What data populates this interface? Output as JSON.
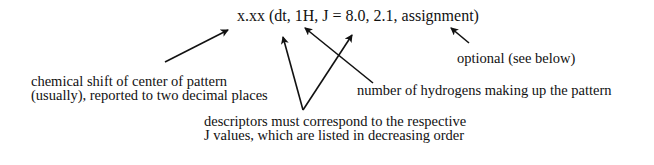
{
  "diagram": {
    "format_string": "x.xx (dt, 1H, J = 8.0, 2.1, assignment)",
    "annotations": {
      "chemical_shift": {
        "line1": "chemical shift of center of pattern",
        "line2": "(usually), reported to two decimal places"
      },
      "hydrogens": {
        "line1": "number of hydrogens making up the pattern"
      },
      "descriptors": {
        "line1": "descriptors must correspond to the respective",
        "line2": "J values, which are listed in decreasing order"
      },
      "optional": {
        "line1": "optional (see below)"
      }
    },
    "arrow_color": "#111111"
  }
}
